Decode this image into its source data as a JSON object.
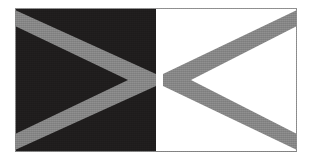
{
  "image": {
    "kind": "flag-illustration",
    "width": 313,
    "height": 166,
    "background_color": "#ffffff",
    "alt_text": "Rectangular flag divided vertically: dark left half with grey chevron pointing right, white right half with grey chevron pointing left"
  },
  "figure": {
    "name": "flag",
    "x": 15,
    "y": 8,
    "width": 282,
    "height": 144,
    "border_color": "#8a8a8a",
    "border_width": 1
  },
  "panels": [
    {
      "name": "left-panel",
      "fill": "#1f1d1d",
      "x": 0,
      "y": 0,
      "width": 141,
      "height": 144,
      "description": "dark field"
    },
    {
      "name": "right-panel",
      "fill": "#ffffff",
      "x": 141,
      "y": 0,
      "width": 141,
      "height": 144,
      "description": "white field"
    }
  ],
  "chevrons": [
    {
      "name": "left-chevron",
      "direction": "right",
      "fill": "#878787",
      "apex": [
        141,
        72
      ],
      "stripe_width": 16,
      "arm_ends": [
        [
          0,
          8
        ],
        [
          0,
          136
        ]
      ],
      "description": "grey chevron opening left, apex at centre seam"
    },
    {
      "name": "right-chevron",
      "direction": "left",
      "fill": "#878787",
      "apex": [
        148,
        72
      ],
      "stripe_width": 16,
      "arm_ends": [
        [
          282,
          8
        ],
        [
          282,
          136
        ]
      ],
      "description": "grey chevron opening right, apex near centre seam"
    }
  ],
  "colors": {
    "dark_field": "#1f1d1d",
    "light_field": "#ffffff",
    "chevron_grey": "#878787",
    "border_grey": "#8a8a8a",
    "page_background": "#ffffff"
  }
}
